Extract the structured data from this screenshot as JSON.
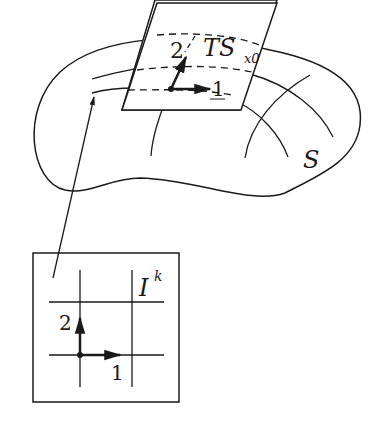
{
  "diagram": {
    "surface_label": "S",
    "tangent_plane": {
      "label_main": "TS",
      "label_sub": "x0",
      "axis1_label": "1",
      "axis2_label": "2"
    },
    "domain_box": {
      "label_main": "I",
      "label_sup": "k",
      "axis1_label": "1",
      "axis2_label": "2"
    },
    "colors": {
      "stroke": "#1a1a1a",
      "background": "#ffffff"
    }
  }
}
